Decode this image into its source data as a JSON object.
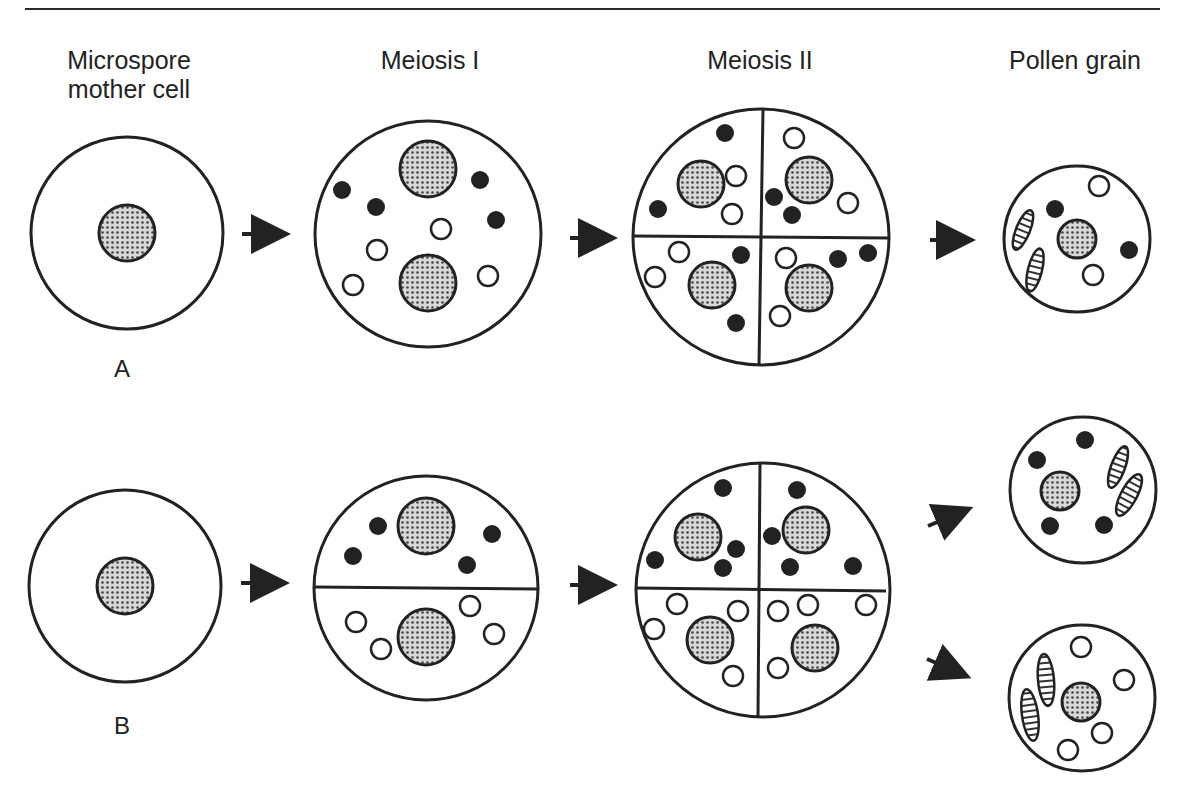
{
  "headers": {
    "col1_line1": "Microspore",
    "col1_line2": "mother cell",
    "col2": "Meiosis I",
    "col3": "Meiosis II",
    "col4": "Pollen grain"
  },
  "rows": {
    "a_label": "A",
    "b_label": "B"
  },
  "colors": {
    "ink": "#222222",
    "background": "#ffffff",
    "nucleus_stipple": "#8a8a8a"
  },
  "legend_semantics": {
    "stippled_circle": "nucleus",
    "filled_dot": "black organelle/marker",
    "open_dot": "white organelle/marker",
    "hatched_ellipse": "plastid"
  }
}
